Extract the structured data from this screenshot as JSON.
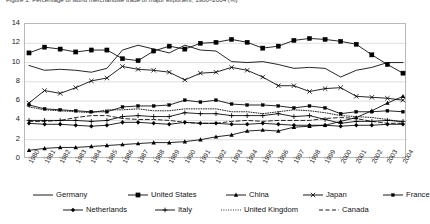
{
  "chart_title": "Figure 1: Percentage of world merchandise trade of major exporters, 1980–2004 (%)",
  "axes": {
    "y_ticks": [
      0,
      2,
      4,
      6,
      8,
      10,
      12,
      14
    ],
    "ylim": [
      0,
      14
    ],
    "x_ticks": [
      "1980",
      "1981",
      "1982",
      "1983",
      "1984",
      "1985",
      "1986",
      "1987",
      "1988",
      "1989",
      "1990",
      "1991",
      "1992",
      "1993",
      "1994",
      "1995",
      "1996",
      "1997",
      "1998",
      "1999",
      "2000",
      "2001",
      "2002",
      "2003",
      "2004"
    ],
    "grid": "horizontal"
  },
  "legend": {
    "row1": [
      {
        "label": "Germany",
        "marker": "none",
        "dash": "solid",
        "name": "legend-item-germany"
      },
      {
        "label": "United States",
        "marker": "square",
        "dash": "solid",
        "name": "legend-item-united-states"
      },
      {
        "label": "China",
        "marker": "triangle",
        "dash": "solid",
        "name": "legend-item-china"
      },
      {
        "label": "Japan",
        "marker": "cross",
        "dash": "solid",
        "name": "legend-item-japan"
      },
      {
        "label": "France",
        "marker": "dot",
        "dash": "solid",
        "name": "legend-item-france"
      }
    ],
    "row2": [
      {
        "label": "Netherlands",
        "marker": "diamond",
        "dash": "solid",
        "name": "legend-item-netherlands"
      },
      {
        "label": "Italy",
        "marker": "plus",
        "dash": "solid",
        "name": "legend-item-italy"
      },
      {
        "label": "United Kingdom",
        "marker": "none",
        "dash": "dotted",
        "name": "legend-item-united-kingdom"
      },
      {
        "label": "Canada",
        "marker": "none",
        "dash": "dashed",
        "name": "legend-item-canada"
      }
    ]
  },
  "chart_data": {
    "type": "line",
    "title": "Figure 1: Percentage of world merchandise trade of major exporters, 1980–2004 (%)",
    "xlabel": "",
    "ylabel": "",
    "ylim": [
      0,
      14
    ],
    "grid": true,
    "legend_position": "bottom",
    "x": [
      "1980",
      "1981",
      "1982",
      "1983",
      "1984",
      "1985",
      "1986",
      "1987",
      "1988",
      "1989",
      "1990",
      "1991",
      "1992",
      "1993",
      "1994",
      "1995",
      "1996",
      "1997",
      "1998",
      "1999",
      "2000",
      "2001",
      "2002",
      "2003",
      "2004"
    ],
    "series": [
      {
        "name": "United States",
        "marker": "square",
        "dash": "solid",
        "color": "#000000",
        "values": [
          11.0,
          11.6,
          11.4,
          11.1,
          11.3,
          11.3,
          10.4,
          10.2,
          11.2,
          11.7,
          11.4,
          12.0,
          12.1,
          12.4,
          12.1,
          11.5,
          11.7,
          12.3,
          12.5,
          12.4,
          12.2,
          11.9,
          10.8,
          9.8,
          8.9
        ],
        "name_key": "united-states"
      },
      {
        "name": "Germany",
        "marker": "none",
        "dash": "solid",
        "color": "#000000",
        "values": [
          9.7,
          9.2,
          9.3,
          9.2,
          9.0,
          9.4,
          11.3,
          11.8,
          11.4,
          11.0,
          11.8,
          11.3,
          11.2,
          10.1,
          10.0,
          10.1,
          9.8,
          9.4,
          9.5,
          9.4,
          8.5,
          9.2,
          9.5,
          10.0,
          10.0
        ],
        "name_key": "germany"
      },
      {
        "name": "Japan",
        "marker": "cross",
        "dash": "solid",
        "color": "#000000",
        "values": [
          5.8,
          7.1,
          6.8,
          7.4,
          8.1,
          8.4,
          9.6,
          9.3,
          9.2,
          9.0,
          8.2,
          8.9,
          9.0,
          9.5,
          9.2,
          8.5,
          7.6,
          7.6,
          7.0,
          7.3,
          7.4,
          6.5,
          6.4,
          6.3,
          6.1
        ],
        "name_key": "japan"
      },
      {
        "name": "France",
        "marker": "dot",
        "dash": "solid",
        "color": "#000000",
        "values": [
          5.6,
          5.2,
          5.1,
          5.0,
          4.9,
          4.9,
          5.4,
          5.5,
          5.5,
          5.6,
          6.1,
          5.9,
          6.1,
          5.7,
          5.6,
          5.6,
          5.5,
          5.3,
          5.5,
          5.3,
          4.7,
          4.9,
          4.9,
          5.0,
          4.9
        ],
        "name_key": "france"
      },
      {
        "name": "United Kingdom",
        "marker": "none",
        "dash": "dotted",
        "color": "#000000",
        "values": [
          5.4,
          5.1,
          5.0,
          4.9,
          4.8,
          5.1,
          5.1,
          5.2,
          5.0,
          5.0,
          5.2,
          5.2,
          5.2,
          4.9,
          4.9,
          4.7,
          4.9,
          5.1,
          5.0,
          4.8,
          4.5,
          4.4,
          4.3,
          4.1,
          3.8
        ],
        "name_key": "united-kingdom"
      },
      {
        "name": "Italy",
        "marker": "plus",
        "dash": "solid",
        "color": "#000000",
        "values": [
          4.0,
          4.0,
          4.0,
          4.0,
          3.9,
          4.0,
          4.4,
          4.5,
          4.4,
          4.4,
          4.8,
          4.7,
          4.7,
          4.5,
          4.5,
          4.5,
          4.7,
          4.4,
          4.5,
          4.1,
          3.7,
          3.9,
          3.9,
          4.0,
          3.9
        ],
        "name_key": "italy"
      },
      {
        "name": "Canada",
        "marker": "none",
        "dash": "dashed",
        "color": "#000000",
        "values": [
          3.9,
          3.9,
          4.0,
          4.3,
          4.5,
          4.5,
          4.2,
          4.1,
          4.1,
          4.0,
          3.8,
          3.7,
          3.7,
          3.9,
          4.0,
          3.9,
          4.0,
          4.0,
          4.0,
          4.2,
          4.3,
          4.2,
          3.9,
          3.7,
          3.7
        ],
        "name_key": "canada"
      },
      {
        "name": "Netherlands",
        "marker": "diamond",
        "dash": "solid",
        "color": "#000000",
        "values": [
          3.7,
          3.6,
          3.6,
          3.5,
          3.4,
          3.5,
          3.8,
          3.8,
          3.7,
          3.6,
          3.8,
          3.7,
          3.7,
          3.6,
          3.6,
          3.7,
          3.6,
          3.5,
          3.5,
          3.5,
          3.4,
          3.5,
          3.5,
          3.6,
          3.6
        ],
        "name_key": "netherlands"
      },
      {
        "name": "China",
        "marker": "triangle",
        "dash": "solid",
        "color": "#000000",
        "values": [
          0.9,
          1.1,
          1.2,
          1.2,
          1.3,
          1.4,
          1.5,
          1.6,
          1.7,
          1.7,
          1.8,
          2.0,
          2.3,
          2.5,
          2.9,
          3.0,
          2.9,
          3.3,
          3.4,
          3.5,
          3.9,
          4.3,
          5.0,
          5.8,
          6.5
        ],
        "name_key": "china"
      }
    ]
  }
}
